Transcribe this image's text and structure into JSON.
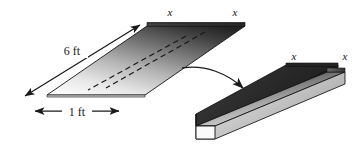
{
  "figure": {
    "background_color": "#ffffff",
    "ink_color": "#1a1a1a",
    "labels": {
      "length_label": "6 ft",
      "width_label": "1 ft",
      "flat_fold_left": "x",
      "flat_fold_right": "x",
      "gutter_wall_near": "x",
      "gutter_wall_far": "x"
    },
    "flat_sheet": {
      "name": "flat-metal-sheet",
      "length_value": "6 ft",
      "width_value": "1 ft",
      "fold_segment_value": "x",
      "fold_line_count": 2,
      "fill_dark": "#2e2e2e",
      "fill_light": "#f2f2f2",
      "edge_color": "#111111"
    },
    "gutter": {
      "name": "folded-gutter",
      "wall_height_value": "x",
      "fill_dark": "#2a2a2a",
      "fill_mid": "#8d8d8d",
      "fill_light": "#ededed",
      "edge_color": "#111111"
    },
    "transform_arrow": {
      "name": "fold-transform-arrow",
      "color": "#1a1a1a",
      "direction": "right-down"
    },
    "dimension_arrows": [
      {
        "name": "length-dimension-arrow",
        "label": "6 ft",
        "style": "double-headed"
      },
      {
        "name": "width-dimension-arrow",
        "label": "1 ft",
        "style": "double-headed"
      }
    ]
  }
}
